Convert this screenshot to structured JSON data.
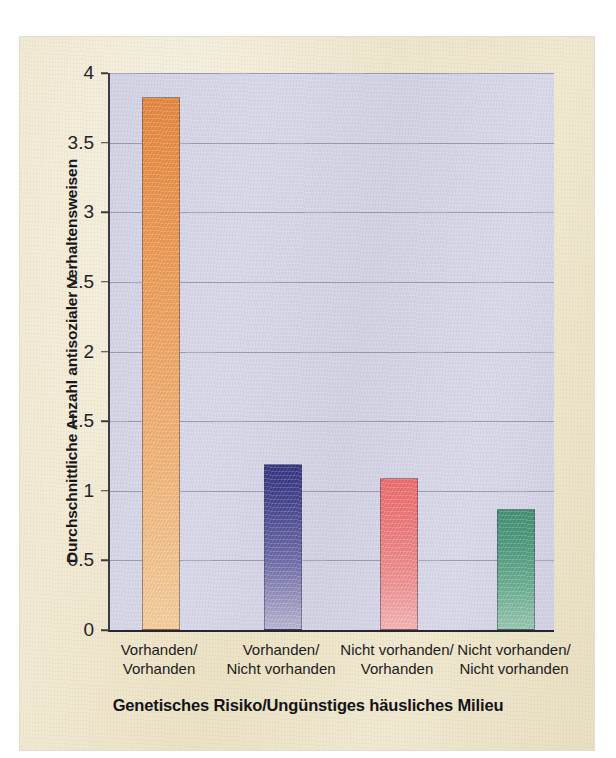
{
  "chart_data": {
    "type": "bar",
    "title": "",
    "subtitle": "",
    "xlabel": "Genetisches Risiko/Ungünstiges häusliches Milieu",
    "ylabel": "Durchschnittliche Anzahl antisozialer Verhaltensweisen",
    "categories": [
      "Vorhanden/ Vorhanden",
      "Vorhanden/ Nicht vorhanden",
      "Nicht vorhanden/ Vorhanden",
      "Nicht vorhanden/ Nicht vorhanden"
    ],
    "category_lines": [
      {
        "line1": "Vorhanden/",
        "line2": "Vorhanden"
      },
      {
        "line1": "Vorhanden/",
        "line2": "Nicht vorhanden"
      },
      {
        "line1": "Nicht vorhanden/",
        "line2": "Vorhanden"
      },
      {
        "line1": "Nicht vorhanden/",
        "line2": "Nicht vorhanden"
      }
    ],
    "values": [
      3.83,
      1.19,
      1.09,
      0.87
    ],
    "ylim": [
      0,
      4
    ],
    "ytick_labels": [
      "0",
      "0.5",
      "1",
      "1.5",
      "2",
      "2.5",
      "3",
      "3.5",
      "4"
    ],
    "ytick_values": [
      0,
      0.5,
      1,
      1.5,
      2,
      2.5,
      3,
      3.5,
      4
    ],
    "grid": true,
    "grid_axis": "y",
    "legend": false,
    "legend_position": "none",
    "bar_colors": [
      "#e8853a",
      "#32327f",
      "#f06a6a",
      "#3f8f71"
    ],
    "plot_background": "#d5d4e6",
    "page_background": "#efe7cd"
  },
  "figure": {
    "y_axis_title": "Durchschnittliche Anzahl antisozialer Verhaltensweisen",
    "x_axis_title": "Genetisches Risiko/Ungünstiges häusliches Milieu"
  }
}
